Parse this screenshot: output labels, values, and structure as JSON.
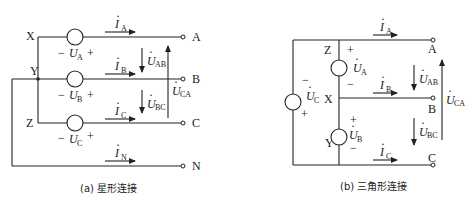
{
  "figure_a": {
    "caption": "(a) 星形连接",
    "nodes": {
      "X": "X",
      "Y": "Y",
      "Z": "Z"
    },
    "terminals": {
      "A": "A",
      "B": "B",
      "C": "C",
      "N": "N"
    },
    "sources": [
      {
        "name": "U",
        "sub": "A",
        "minus": "−",
        "plus": "+"
      },
      {
        "name": "U",
        "sub": "B",
        "minus": "−",
        "plus": "+"
      },
      {
        "name": "U",
        "sub": "C",
        "minus": "−",
        "plus": "+"
      }
    ],
    "currents": [
      {
        "name": "I",
        "sub": "A"
      },
      {
        "name": "I",
        "sub": "B"
      },
      {
        "name": "I",
        "sub": "C"
      },
      {
        "name": "I",
        "sub": "N"
      }
    ],
    "voltages": [
      {
        "name": "U",
        "sub": "AB"
      },
      {
        "name": "U",
        "sub": "BC"
      },
      {
        "name": "U",
        "sub": "CA"
      }
    ]
  },
  "figure_b": {
    "caption": "(b) 三角形连接",
    "nodes": {
      "X": "X",
      "Y": "Y",
      "Z": "Z"
    },
    "terminals": {
      "A": "A",
      "B": "B",
      "C": "C"
    },
    "sources": [
      {
        "name": "U",
        "sub": "A",
        "plus": "+",
        "minus": "−"
      },
      {
        "name": "U",
        "sub": "B",
        "plus": "+",
        "minus": "−"
      },
      {
        "name": "U",
        "sub": "C",
        "plus": "+",
        "minus": "−"
      }
    ],
    "currents": [
      {
        "name": "I",
        "sub": "A"
      },
      {
        "name": "I",
        "sub": "B"
      },
      {
        "name": "I",
        "sub": "C"
      }
    ],
    "voltages": [
      {
        "name": "U",
        "sub": "AB"
      },
      {
        "name": "U",
        "sub": "BC"
      },
      {
        "name": "U",
        "sub": "CA"
      }
    ]
  }
}
